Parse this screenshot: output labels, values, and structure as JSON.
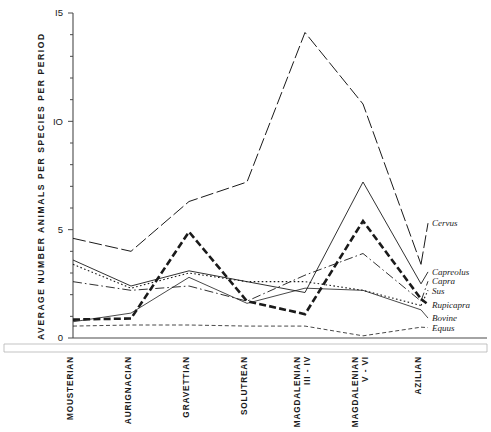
{
  "figure": {
    "title_visible": false,
    "caption": ""
  },
  "chart_data": {
    "type": "line",
    "title": "",
    "xlabel": "",
    "ylabel": "AVERAGE  NUMBER  ANIMALS  PER  SPECIES  PER  PERIOD",
    "ylim": [
      0,
      15
    ],
    "yticks": [
      0,
      5,
      10,
      15
    ],
    "ytick_labels": [
      "0",
      "5",
      "IO",
      "I5"
    ],
    "yminor_step": 1,
    "grid": false,
    "legend_position": "right-inline",
    "categories": [
      "MOUSTERIAN",
      "AURIGNACIAN",
      "GRAVETTIAN",
      "SOLUTREAN",
      "MAGDALENIAN III - IV",
      "MAGDALENIAN V - VI",
      "AZILIAN"
    ],
    "category_lines": [
      [
        "MOUSTERIAN"
      ],
      [
        "AURIGNACIAN"
      ],
      [
        "GRAVETTIAN"
      ],
      [
        "SOLUTREAN"
      ],
      [
        "MAGDALENIAN",
        "III - IV"
      ],
      [
        "MAGDALENIAN",
        "V - VI"
      ],
      [
        "AZILIAN"
      ]
    ],
    "series": [
      {
        "name": "Cervus",
        "style": "long-dash",
        "width": 1.0,
        "values": [
          4.6,
          4.0,
          6.3,
          7.2,
          14.1,
          10.8,
          3.4
        ]
      },
      {
        "name": "Capreolus",
        "style": "solid",
        "width": 0.9,
        "values": [
          3.6,
          2.4,
          3.1,
          2.6,
          2.1,
          7.2,
          2.5
        ]
      },
      {
        "name": "Capra",
        "style": "dash-dot",
        "width": 0.9,
        "values": [
          2.6,
          2.2,
          2.4,
          1.7,
          2.9,
          3.9,
          1.7
        ]
      },
      {
        "name": "Sus",
        "style": "dotted",
        "width": 1.1,
        "values": [
          3.4,
          2.3,
          3.0,
          2.6,
          2.6,
          2.2,
          1.5
        ]
      },
      {
        "name": "Rupicapra",
        "style": "thick-dash",
        "width": 2.6,
        "values": [
          0.85,
          0.9,
          4.9,
          1.7,
          1.1,
          5.4,
          1.8
        ]
      },
      {
        "name": "Bovine",
        "style": "solid",
        "width": 0.8,
        "values": [
          0.75,
          1.15,
          2.8,
          1.6,
          2.3,
          2.2,
          1.3
        ]
      },
      {
        "name": "Equus",
        "style": "fine-dash",
        "width": 0.8,
        "values": [
          0.55,
          0.6,
          0.6,
          0.55,
          0.55,
          0.1,
          0.5
        ]
      }
    ],
    "legend_entries": [
      {
        "label": "Cervus",
        "y_value": 5.3
      },
      {
        "label": "Capreolus",
        "y_value": 3.05
      },
      {
        "label": "Capra",
        "y_value": 2.62
      },
      {
        "label": "Sus",
        "y_value": 2.2
      },
      {
        "label": "Rupicapra",
        "y_value": 1.55
      },
      {
        "label": "Bovine",
        "y_value": 0.92
      },
      {
        "label": "Equus",
        "y_value": 0.48
      }
    ]
  }
}
